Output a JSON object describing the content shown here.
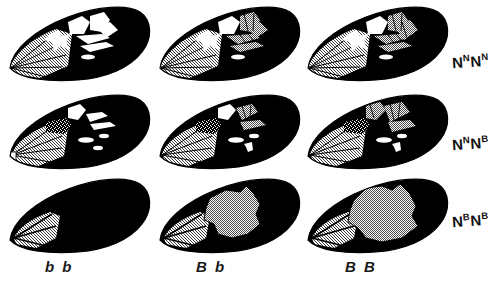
{
  "figure": {
    "type": "genotype-grid",
    "background_color": "#ffffff",
    "ink_color": "#000000",
    "grey_color": "#bdbdbd",
    "white_patch_color": "#ffffff",
    "rows": 3,
    "columns": 3
  },
  "row_labels": [
    {
      "id": "row-1",
      "base": "N",
      "sup1": "N",
      "base2": "N",
      "sup2": "N",
      "text": "NNNN"
    },
    {
      "id": "row-2",
      "base": "N",
      "sup1": "N",
      "base2": "N",
      "sup2": "B",
      "text": "NNNB"
    },
    {
      "id": "row-3",
      "base": "N",
      "sup1": "B",
      "base2": "N",
      "sup2": "B",
      "text": "NBNB"
    }
  ],
  "column_labels": [
    {
      "id": "col-1",
      "text": "b b"
    },
    {
      "id": "col-2",
      "text": "B b"
    },
    {
      "id": "col-3",
      "text": "B B"
    }
  ],
  "cells": [
    {
      "id": "cell-r1c1",
      "row_genotype": "NNNN",
      "column_genotype": "bb",
      "description": "black forewing with large white band patches and grey basal streaks"
    },
    {
      "id": "cell-r1c2",
      "row_genotype": "NNNN",
      "column_genotype": "Bb",
      "description": "black forewing, white patches partly shaded grey"
    },
    {
      "id": "cell-r1c3",
      "row_genotype": "NNNN",
      "column_genotype": "BB",
      "description": "black forewing, band patches mostly grey"
    },
    {
      "id": "cell-r2c1",
      "row_genotype": "NNNB",
      "column_genotype": "bb",
      "description": "black forewing with reduced white patches and a speckled patch"
    },
    {
      "id": "cell-r2c2",
      "row_genotype": "NNNB",
      "column_genotype": "Bb",
      "description": "black forewing, reduced patches partly grey, speckled patch"
    },
    {
      "id": "cell-r2c3",
      "row_genotype": "NNNB",
      "column_genotype": "BB",
      "description": "black forewing, reduced patches mostly grey, speckled patch"
    },
    {
      "id": "cell-r3c1",
      "row_genotype": "NBNB",
      "column_genotype": "bb",
      "description": "entirely black forewing with grey basal streaks only"
    },
    {
      "id": "cell-r3c2",
      "row_genotype": "NBNB",
      "column_genotype": "Bb",
      "description": "black forewing with a single large irregular grey central blotch"
    },
    {
      "id": "cell-r3c3",
      "row_genotype": "NBNB",
      "column_genotype": "BB",
      "description": "black forewing with a larger irregular grey central blotch"
    }
  ]
}
